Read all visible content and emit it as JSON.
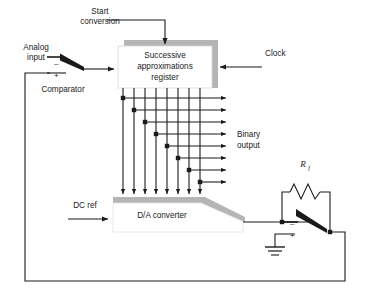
{
  "diagram": {
    "colors": {
      "line": "#1a1a1a",
      "shadow": "#9a9a9a",
      "box_fill": "#ffffff",
      "background": "#ffffff",
      "text": "#1a1a1a"
    },
    "blocks": [
      {
        "id": "sar",
        "label_line1": "Successive",
        "label_line2": "approximations",
        "label_line3": "register",
        "shape": "rectangle-with-shadow"
      },
      {
        "id": "dac",
        "label": "D/A converter",
        "shape": "trapezoid-with-shadow"
      }
    ],
    "labels": {
      "start_conversion_line1": "Start",
      "start_conversion_line2": "conversion",
      "analog_input_line1": "Analog",
      "analog_input_line2": "input",
      "clock": "Clock",
      "comparator": "Comparator",
      "binary_output_line1": "Binary",
      "binary_output_line2": "output",
      "dc_ref": "DC ref",
      "feedback_resistor": "R",
      "feedback_resistor_sub": "f",
      "minus_sign": "–",
      "plus_sign": "+"
    },
    "bit_lines": {
      "count": 8,
      "vertical_x": [
        123,
        134,
        145,
        156,
        167,
        178,
        189,
        200
      ],
      "horizontal_y": [
        98,
        110,
        122,
        134,
        146,
        158,
        170,
        182
      ],
      "junction_dots": 8,
      "arrow_end_x": 228,
      "vertical_top_y": 88,
      "vertical_bottom_y": 197
    },
    "components": {
      "comparator_input": "comparator-switch-symbol",
      "comparator_output": "comparator-switch-symbol",
      "ground": "ground-symbol",
      "resistor": "zigzag-resistor"
    }
  }
}
